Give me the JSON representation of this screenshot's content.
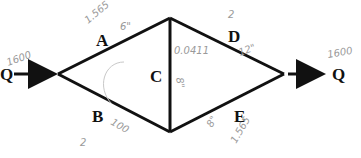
{
  "diagram": {
    "type": "pipe network",
    "inlet": {
      "label": "Q",
      "flow_note": "1600"
    },
    "outlet": {
      "label": "Q",
      "flow_note": "1600"
    },
    "pipes": [
      {
        "id": "A",
        "label": "A",
        "notes": [
          "1.565",
          "6\""
        ]
      },
      {
        "id": "B",
        "label": "B",
        "notes": [
          "100",
          "2"
        ]
      },
      {
        "id": "C",
        "label": "C",
        "notes": [
          "0.0411",
          "8\""
        ]
      },
      {
        "id": "D",
        "label": "D",
        "notes": [
          "2",
          "12\""
        ]
      },
      {
        "id": "E",
        "label": "E",
        "notes": [
          "8\"",
          "1.565"
        ]
      }
    ]
  }
}
